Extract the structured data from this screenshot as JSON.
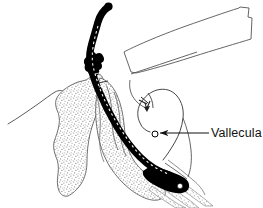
{
  "figure": {
    "kind": "anatomical-line-drawing",
    "background_color": "#ffffff",
    "line_color": "#1a1a1a",
    "tube_color": "#000000",
    "stipple_color": "#8c8c8c",
    "width": 263,
    "height": 208
  },
  "annotations": [
    {
      "id": "vallecula",
      "label": "Vallecula",
      "text_x": 211,
      "text_y": 137,
      "leader_start_x": 209,
      "leader_start_y": 133,
      "leader_mid_x": 181,
      "leader_mid_y": 133,
      "arrow_tip_x": 158,
      "arrow_tip_y": 133,
      "color": "#111111"
    }
  ],
  "structures": [
    {
      "id": "tube-shaft",
      "name": "endotracheal-tube-shaft",
      "fill": "#000000"
    },
    {
      "id": "tube-connector",
      "name": "tube-connector-hub",
      "fill": "#000000"
    },
    {
      "id": "tube-tip",
      "name": "tube-distal-tip",
      "fill": "#000000"
    },
    {
      "id": "tube-centerline",
      "name": "tube-radiopaque-stripe",
      "fill": "#ffffff"
    },
    {
      "id": "mandible-bone",
      "name": "mandible-stippled-bone",
      "fill": "#8c8c8c"
    },
    {
      "id": "tongue-body",
      "name": "tongue-stippled-body",
      "fill": "#8c8c8c"
    },
    {
      "id": "soft-palate",
      "name": "soft-palate-outline",
      "fill": "none"
    },
    {
      "id": "epiglottis",
      "name": "epiglottis-outline",
      "fill": "none"
    },
    {
      "id": "face-profile",
      "name": "face-profile-outline",
      "fill": "none"
    },
    {
      "id": "nasal-block",
      "name": "upper-jaw-block-outline",
      "fill": "none"
    },
    {
      "id": "tracheal-rings",
      "name": "tracheal-rings-stippled",
      "fill": "#8c8c8c"
    },
    {
      "id": "vallecula-marker",
      "name": "vallecula-marker-circle",
      "fill": "#ffffff"
    }
  ]
}
